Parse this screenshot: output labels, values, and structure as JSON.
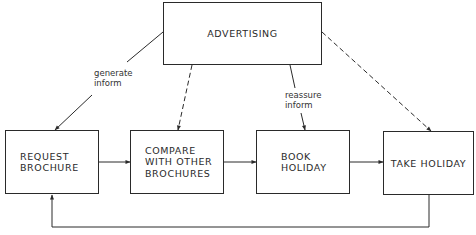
{
  "diagram": {
    "nodes": {
      "advertising": "ADVERTISING",
      "request": "REQUEST\nBROCHURE",
      "compare": "COMPARE\nWITH OTHER\nBROCHURES",
      "book": "BOOK\nHOLIDAY",
      "take": "TAKE HOLIDAY"
    },
    "edge_labels": {
      "generate": "generate\ninform",
      "reassure": "reassure\ninform"
    },
    "edges": [
      {
        "from": "advertising",
        "to": "request",
        "style": "solid",
        "label": "generate inform"
      },
      {
        "from": "advertising",
        "to": "compare",
        "style": "dashed"
      },
      {
        "from": "advertising",
        "to": "book",
        "style": "solid",
        "label": "reassure inform"
      },
      {
        "from": "advertising",
        "to": "take",
        "style": "dashed"
      },
      {
        "from": "request",
        "to": "compare",
        "style": "solid"
      },
      {
        "from": "compare",
        "to": "book",
        "style": "solid"
      },
      {
        "from": "book",
        "to": "take",
        "style": "solid"
      },
      {
        "from": "take",
        "to": "request",
        "style": "solid",
        "note": "feedback loop"
      }
    ]
  }
}
